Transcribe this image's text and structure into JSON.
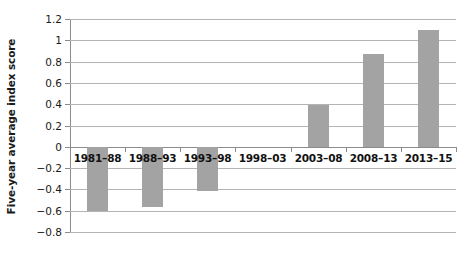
{
  "chart_data": {
    "type": "bar",
    "title": "",
    "subtitle": "",
    "xlabel": "",
    "ylabel": "Five-year average index score",
    "categories": [
      "1981–88",
      "1988–93",
      "1993–98",
      "1998–03",
      "2003–08",
      "2008–13",
      "2013–15"
    ],
    "values": [
      -0.6,
      -0.56,
      -0.41,
      0,
      0.39,
      0.87,
      1.1
    ],
    "ylim": [
      -0.8,
      1.2
    ],
    "ytick_labels": [
      "1.2",
      "1",
      "0.8",
      "0.6",
      "0.4",
      "0.2",
      "0",
      "−0.2",
      "−0.4",
      "−0.6",
      "−0.8"
    ],
    "ytick_values": [
      1.2,
      1,
      0.8,
      0.6,
      0.4,
      0.2,
      0,
      -0.2,
      -0.4,
      -0.6,
      -0.8
    ],
    "grid": true,
    "legend": "none",
    "bar_color": "#a3a3a3",
    "gridline_color": "#b4b4b4",
    "axis_color": "#8c8c8c",
    "text_color": "#1a1a1a"
  }
}
